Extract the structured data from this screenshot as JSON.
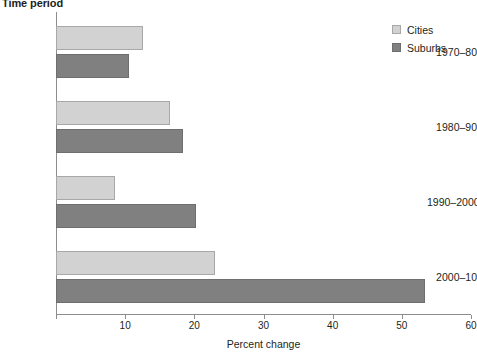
{
  "chart_data": {
    "type": "bar",
    "orientation": "horizontal",
    "title": "",
    "categories": [
      "1970–80",
      "1980–90",
      "1990–2000",
      "2000–10"
    ],
    "series": [
      {
        "name": "Cities",
        "values": [
          12.6,
          16.5,
          8.6,
          23.0
        ],
        "color": "#d2d2d2"
      },
      {
        "name": "Suburbs",
        "values": [
          10.6,
          18.4,
          20.3,
          53.3
        ],
        "color": "#808080"
      }
    ],
    "xlabel": "Percent change",
    "ylabel": "Time period",
    "xlim": [
      0,
      60
    ],
    "xticks": [
      0,
      10,
      20,
      30,
      40,
      50,
      60
    ],
    "xtick_labels": [
      "",
      "10",
      "20",
      "30",
      "40",
      "50",
      "60"
    ],
    "grid": false,
    "legend_position": "top-right"
  },
  "axes": {
    "y_title": "Time period",
    "x_title": "Percent change"
  },
  "legend": {
    "entries": [
      {
        "label": "Cities",
        "swatch": "cities-swatch"
      },
      {
        "label": "Suburbs",
        "swatch": "suburbs-swatch"
      }
    ]
  },
  "colors": {
    "cities": "#d2d2d2",
    "suburbs": "#808080",
    "axis": "#8d8d8d",
    "text": "#231f20"
  }
}
